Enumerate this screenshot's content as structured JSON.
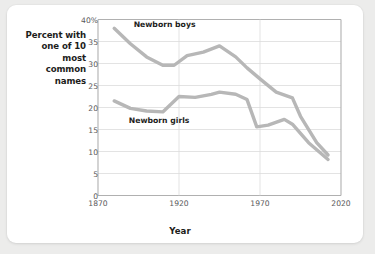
{
  "chart_data": {
    "type": "line",
    "title": "",
    "xlabel": "Year",
    "ylabel_lines": [
      "Percent with",
      "one of 10",
      "most",
      "common",
      "names"
    ],
    "xlim": [
      1870,
      2020
    ],
    "ylim": [
      0,
      40
    ],
    "xticks": [
      "1870",
      "1920",
      "1970",
      "2020"
    ],
    "xtick_values": [
      1870,
      1920,
      1970,
      2020
    ],
    "yticks": [
      "0",
      "5",
      "10",
      "15",
      "20",
      "25",
      "30",
      "35",
      "40%"
    ],
    "ytick_values": [
      0,
      5,
      10,
      15,
      20,
      25,
      30,
      35,
      40
    ],
    "grid": "horizontal-and-vertical-at-xticks",
    "legend_position": "inline-annotations",
    "line_color": "#b7b7b7",
    "grid_color": "#dcdcdc",
    "axis_color": "#b0b0b0",
    "series": [
      {
        "name": "Newborn boys",
        "label_x": 1892,
        "label_y": 38.8,
        "x": [
          1880,
          1890,
          1900,
          1910,
          1917,
          1925,
          1935,
          1945,
          1955,
          1962,
          1970,
          1980,
          1990,
          1995,
          2005,
          2012
        ],
        "values": [
          38.0,
          34.5,
          31.5,
          29.6,
          29.6,
          31.8,
          32.6,
          34.0,
          31.5,
          29.0,
          26.5,
          23.5,
          22.2,
          18.0,
          12.0,
          9.2
        ]
      },
      {
        "name": "Newborn girls",
        "label_x": 1889,
        "label_y": 17.0,
        "x": [
          1880,
          1890,
          1900,
          1910,
          1920,
          1930,
          1940,
          1945,
          1955,
          1962,
          1968,
          1975,
          1985,
          1990,
          2000,
          2012
        ],
        "values": [
          21.5,
          19.8,
          19.2,
          19.0,
          22.5,
          22.3,
          23.0,
          23.5,
          23.0,
          21.8,
          15.6,
          16.0,
          17.3,
          16.2,
          12.0,
          8.2
        ]
      }
    ]
  }
}
